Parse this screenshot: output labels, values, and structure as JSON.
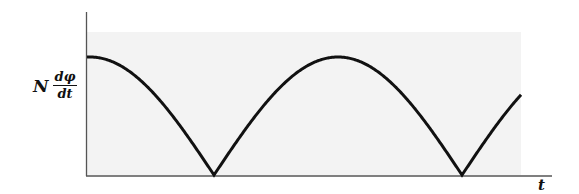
{
  "figure": {
    "y_label": {
      "prefix": "N",
      "numerator": "dφ",
      "denominator": "dt"
    },
    "x_label": "t",
    "colors": {
      "curve": "#111111",
      "axis": "#555555",
      "shading": "#f3f3f3",
      "background": "#ffffff"
    }
  },
  "chart_data": {
    "type": "line",
    "title": "",
    "xlabel": "t",
    "ylabel": "N dφ/dt",
    "x_ticks": [],
    "y_ticks": [],
    "grid": false,
    "legend": null,
    "series": [
      {
        "name": "N dφ/dt",
        "shape": "|cos|",
        "x": [
          0,
          0.5,
          1.0,
          1.5,
          2.0,
          2.35
        ],
        "y": [
          1.0,
          0.0,
          1.0,
          0.0,
          1.0,
          0.68
        ],
        "notes": "starts near maximum, cusps (zeros) at half-periods, ends rising"
      }
    ],
    "ylim": [
      0,
      1.3
    ]
  }
}
